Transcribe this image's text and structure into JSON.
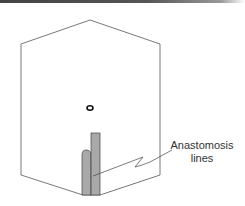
{
  "diagram": {
    "type": "cutaway block with graft strip",
    "label": {
      "line1": "Anastomosis",
      "line2": "lines"
    },
    "colors": {
      "outline": "#555555",
      "strip_fill": "#a9a9a9",
      "text": "#333333"
    }
  }
}
